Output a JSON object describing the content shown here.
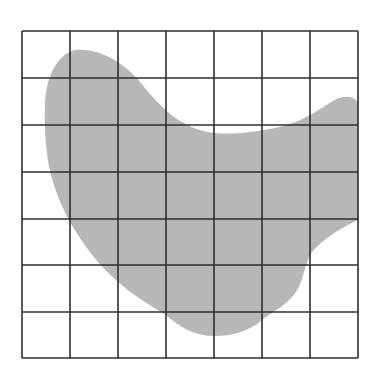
{
  "figure": {
    "grid": {
      "columns": 7,
      "rows": 7,
      "left": 22,
      "top": 31,
      "right": 358,
      "bottom": 358,
      "line_color": "#2e2e2e",
      "background": "#ffffff"
    },
    "shape": {
      "fill_color": "#b7b7b7",
      "label": "irregular region"
    }
  }
}
